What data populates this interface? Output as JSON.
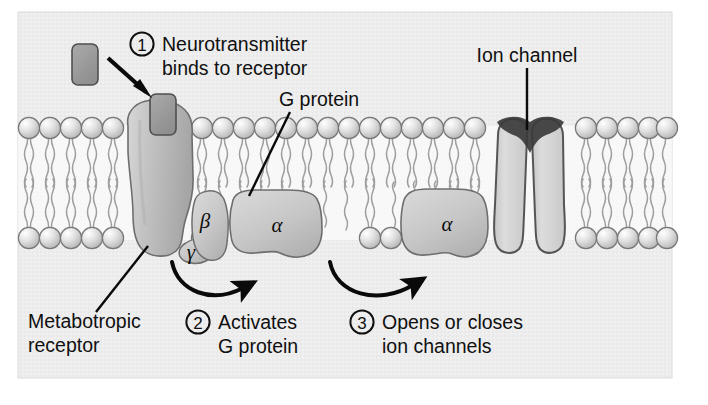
{
  "figure": {
    "panel": {
      "background_color": "#eeeeee",
      "border_color": "#d8d8d8"
    }
  },
  "labels": {
    "step1_number": "1",
    "step1_line1": "Neurotransmitter",
    "step1_line2": "binds to receptor",
    "g_protein": "G protein",
    "ion_channel": "Ion channel",
    "metabotropic_line1": "Metabotropic",
    "metabotropic_line2": "receptor",
    "step2_number": "2",
    "step2_line1": "Activates",
    "step2_line2": "G protein",
    "step3_number": "3",
    "step3_line1": "Opens or closes",
    "step3_line2": "ion channels"
  },
  "subunits": {
    "beta": "β",
    "gamma": "γ",
    "alpha_bound": "α",
    "alpha_free": "α"
  },
  "colors": {
    "panel_bg": "#ededed",
    "membrane_head_fill": "#dcdcdc",
    "membrane_head_stroke": "#7d7d7d",
    "tail_stroke": "#9a9a9a",
    "protein_fill": "#c9c9c9",
    "protein_stroke": "#6e6e6e",
    "receptor_fill": "#bdbdbd",
    "neurotransmitter_fill": "#9e9e9e",
    "neurotransmitter_stroke": "#5a5a5a",
    "channel_fill": "#d4d4d4",
    "channel_stroke": "#555555",
    "arrow_black": "#0a0a0a",
    "text_black": "#101010"
  },
  "elements": {
    "neurotransmitter_free": "free neurotransmitter molecule",
    "neurotransmitter_bound": "neurotransmitter bound in receptor pocket",
    "binding_arrow": "arrow from free neurotransmitter to receptor",
    "activation_arrow": "curved arrow from receptor to alpha subunit",
    "channel_arrow": "curved arrow from alpha subunit to ion channel",
    "membrane": "lipid bilayer"
  }
}
